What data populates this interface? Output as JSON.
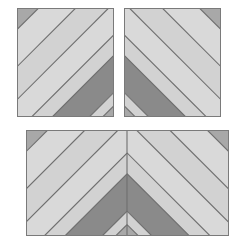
{
  "page": {
    "background_color": "#ffffff",
    "width": 246,
    "height": 243
  },
  "palette": {
    "light_stripe": "#d9d9d9",
    "light_stripe_alt": "#d2d2d2",
    "medium_stripe": "#a8a8a8",
    "dark_stripe": "#8a8a8a",
    "seam_line": "#6e6e6e",
    "border": "#7a7a7a",
    "background": "#ffffff"
  },
  "blocks": [
    {
      "id": "block-top-left",
      "name": "Top Left Block",
      "x": 17,
      "y": 8,
      "width": 97,
      "height": 109,
      "direction": "bottom-left-to-top-right",
      "mirrored": false,
      "stripe_angle_deg": 45,
      "stripe_count": 7,
      "stripes": [
        {
          "index": 0,
          "color": "#a8a8a8",
          "label": "corner-medium"
        },
        {
          "index": 1,
          "color": "#d9d9d9",
          "label": "light"
        },
        {
          "index": 2,
          "color": "#d2d2d2",
          "label": "light-alt"
        },
        {
          "index": 3,
          "color": "#d9d9d9",
          "label": "light"
        },
        {
          "index": 4,
          "color": "#d2d2d2",
          "label": "light-alt"
        },
        {
          "index": 5,
          "color": "#8a8a8a",
          "label": "dark-wide"
        },
        {
          "index": 6,
          "color": "#d2d2d2",
          "label": "light-alt"
        },
        {
          "index": 7,
          "color": "#a8a8a8",
          "label": "corner-medium"
        }
      ]
    },
    {
      "id": "block-top-right",
      "name": "Top Right Block",
      "x": 124,
      "y": 8,
      "width": 97,
      "height": 109,
      "direction": "bottom-right-to-top-left",
      "mirrored": true,
      "stripe_angle_deg": 135,
      "stripe_count": 7,
      "stripes": [
        {
          "index": 0,
          "color": "#a8a8a8",
          "label": "corner-medium"
        },
        {
          "index": 1,
          "color": "#d9d9d9",
          "label": "light"
        },
        {
          "index": 2,
          "color": "#d2d2d2",
          "label": "light-alt"
        },
        {
          "index": 3,
          "color": "#d9d9d9",
          "label": "light"
        },
        {
          "index": 4,
          "color": "#d2d2d2",
          "label": "light-alt"
        },
        {
          "index": 5,
          "color": "#8a8a8a",
          "label": "dark-wide"
        },
        {
          "index": 6,
          "color": "#d2d2d2",
          "label": "light-alt"
        },
        {
          "index": 7,
          "color": "#a8a8a8",
          "label": "corner-medium"
        }
      ]
    },
    {
      "id": "block-bottom-chevron",
      "name": "Bottom Chevron Block",
      "x": 26,
      "y": 130,
      "width": 203,
      "height": 106,
      "direction": "chevron-v",
      "mirrored": false,
      "stripe_angle_deg": 45,
      "halves": [
        "left-mirrored",
        "right-mirrored"
      ],
      "center_seam_x": 101,
      "stripe_count": 7
    }
  ],
  "labels": {
    "caption": ""
  }
}
